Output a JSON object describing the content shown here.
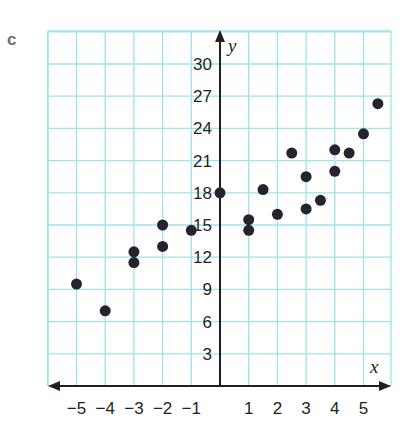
{
  "panel_label": "c",
  "chart_data": {
    "type": "scatter",
    "title": "",
    "xlabel": "x",
    "ylabel": "y",
    "x_ticks": [
      -5,
      -4,
      -3,
      -2,
      -1,
      1,
      2,
      3,
      4,
      5
    ],
    "y_ticks": [
      3,
      6,
      9,
      12,
      15,
      18,
      21,
      24,
      27,
      30
    ],
    "xlim": [
      -6,
      6
    ],
    "ylim": [
      0,
      33
    ],
    "grid": true,
    "grid_color": "#9ee3ec",
    "point_color": "#25232e",
    "points": [
      {
        "x": -5,
        "y": 9.5
      },
      {
        "x": -4,
        "y": 7
      },
      {
        "x": -3,
        "y": 12.5
      },
      {
        "x": -3,
        "y": 11.5
      },
      {
        "x": -2,
        "y": 15
      },
      {
        "x": -2,
        "y": 13
      },
      {
        "x": -1,
        "y": 14.5
      },
      {
        "x": 0,
        "y": 18
      },
      {
        "x": 1,
        "y": 15.5
      },
      {
        "x": 1,
        "y": 14.5
      },
      {
        "x": 1.5,
        "y": 18.3
      },
      {
        "x": 2,
        "y": 16
      },
      {
        "x": 2.5,
        "y": 21.7
      },
      {
        "x": 3,
        "y": 19.5
      },
      {
        "x": 3,
        "y": 16.5
      },
      {
        "x": 3.5,
        "y": 17.3
      },
      {
        "x": 4,
        "y": 22
      },
      {
        "x": 4,
        "y": 20
      },
      {
        "x": 4.5,
        "y": 21.7
      },
      {
        "x": 5,
        "y": 23.5
      },
      {
        "x": 5.5,
        "y": 26.3
      }
    ]
  }
}
